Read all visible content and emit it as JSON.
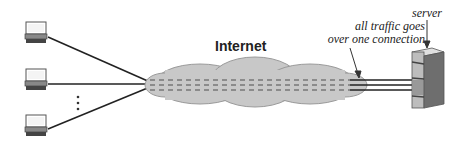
{
  "diagram": {
    "cloud_label": "Internet",
    "annotation": {
      "line1": "all traffic goes",
      "line2": "over one connection"
    },
    "server_label": "server",
    "ellipsis": "⋮",
    "nodes": [
      {
        "type": "client-computer",
        "label": ""
      },
      {
        "type": "client-computer",
        "label": ""
      },
      {
        "type": "client-computer",
        "label": ""
      }
    ],
    "colors": {
      "cloud_fill": "#c8c8c8",
      "cloud_stroke": "#9a9a9a",
      "line": "#222222",
      "server_body": "#bdbdbd",
      "server_side": "#6e6e6e"
    }
  }
}
